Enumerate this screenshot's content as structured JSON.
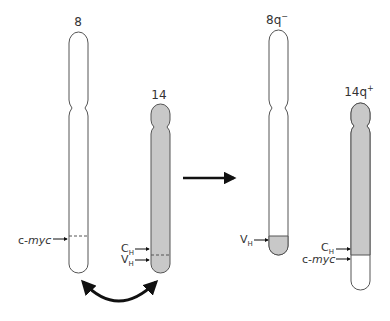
{
  "diagram": {
    "colors": {
      "outline": "#555555",
      "shaded": "#c8c8c8",
      "unshaded": "#ffffff",
      "arrow": "#111111"
    },
    "before": {
      "chromosome_8": {
        "label": "8",
        "markers": [
          {
            "label": "c-myc",
            "italic_part": "myc",
            "prefix": "c-"
          }
        ]
      },
      "chromosome_14": {
        "label": "14",
        "markers": [
          {
            "label": "C_H",
            "main": "C",
            "subscript": "H"
          },
          {
            "label": "V_H",
            "main": "V",
            "subscript": "H"
          }
        ]
      },
      "exchange_arrow": "double-headed-curved-arrow"
    },
    "transition_arrow": "right-arrow",
    "after": {
      "chromosome_8q_minus": {
        "label": "8q-",
        "main": "8q",
        "superscript": "−",
        "markers": [
          {
            "label": "V_H",
            "main": "V",
            "subscript": "H"
          }
        ]
      },
      "chromosome_14q_plus": {
        "label": "14q+",
        "main": "14q",
        "superscript": "+",
        "markers": [
          {
            "label": "C_H",
            "main": "C",
            "subscript": "H"
          },
          {
            "label": "c-myc",
            "italic_part": "myc",
            "prefix": "c-"
          }
        ]
      }
    }
  }
}
